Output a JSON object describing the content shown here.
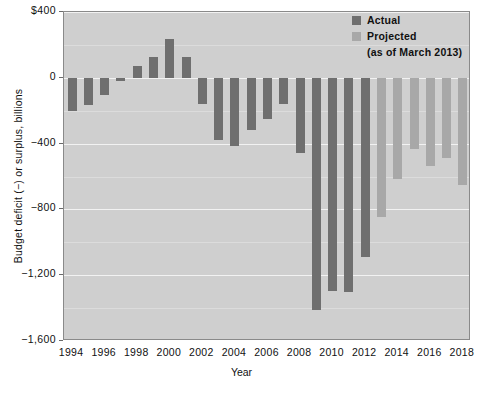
{
  "chart_data": {
    "type": "bar",
    "title": "",
    "xlabel": "Year",
    "ylabel": "Budget deficit (−) or surplus, billions",
    "ylim": [
      -1600,
      400
    ],
    "grid": true,
    "legend_position": "top-right",
    "categories": [
      1994,
      1995,
      1996,
      1997,
      1998,
      1999,
      2000,
      2001,
      2002,
      2003,
      2004,
      2005,
      2006,
      2007,
      2008,
      2009,
      2010,
      2011,
      2012,
      2013,
      2014,
      2015,
      2016,
      2017,
      2018
    ],
    "series": [
      {
        "name": "Actual",
        "color": "#6f6f6f",
        "values": [
          -203,
          -164,
          -107,
          -22,
          69,
          126,
          236,
          128,
          -158,
          -378,
          -413,
          -318,
          -248,
          -161,
          -459,
          -1413,
          -1294,
          -1300,
          -1087,
          null,
          null,
          null,
          null,
          null,
          null
        ]
      },
      {
        "name": "Projected",
        "color": "#a8a8a8",
        "values": [
          null,
          null,
          null,
          null,
          null,
          null,
          null,
          null,
          null,
          null,
          null,
          null,
          null,
          null,
          null,
          null,
          null,
          null,
          null,
          -845,
          -616,
          -430,
          -535,
          -487,
          -650
        ]
      }
    ],
    "yticks": [
      400,
      0,
      -400,
      -800,
      -1200,
      -1600
    ],
    "ytick_labels": [
      "$400",
      "0",
      "−400",
      "−800",
      "−1,200",
      "−1,600"
    ],
    "xticks": [
      1994,
      1996,
      1998,
      2000,
      2002,
      2004,
      2006,
      2008,
      2010,
      2012,
      2014,
      2016,
      2018
    ],
    "xtick_labels": [
      "1994",
      "1996",
      "1998",
      "2000",
      "2002",
      "2004",
      "2006",
      "2008",
      "2010",
      "2012",
      "2014",
      "2016",
      "2018"
    ]
  },
  "legend": {
    "actual_label": "Actual",
    "projected_label": "Projected",
    "projected_note": "(as of March 2013)"
  },
  "axes": {
    "y_title": "Budget deficit (−) or surplus, billions",
    "x_title": "Year"
  }
}
